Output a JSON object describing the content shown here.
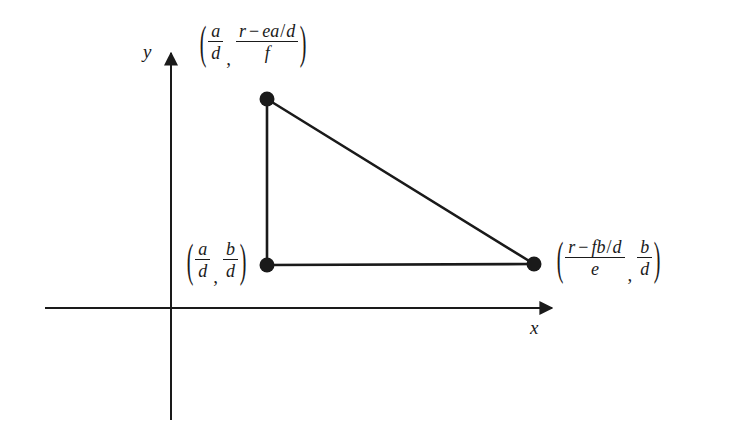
{
  "figure": {
    "type": "geometry-diagram",
    "background_color": "#ffffff",
    "ink_color": "#1a1a1a",
    "axes": {
      "x_label": "x",
      "y_label": "y",
      "origin": {
        "x": 171,
        "y": 308
      },
      "x_axis": {
        "start_x": 45,
        "end_x": 557,
        "y": 308,
        "arrow": "right"
      },
      "y_axis": {
        "x": 171,
        "start_y": 420,
        "end_y": 48,
        "arrow": "up"
      }
    },
    "vertices": [
      {
        "name": "top-vertex",
        "point": {
          "x": 267,
          "y": 99
        },
        "label": {
          "x_expr": {
            "numerator": "a",
            "denominator": "d"
          },
          "y_expr": {
            "numerator": [
              "r",
              "−",
              "ea",
              "/",
              "d"
            ],
            "denominator": "f"
          }
        }
      },
      {
        "name": "bottom-left-vertex",
        "point": {
          "x": 267,
          "y": 265
        },
        "label": {
          "x_expr": {
            "numerator": "a",
            "denominator": "d"
          },
          "y_expr": {
            "numerator": "b",
            "denominator": "d"
          }
        }
      },
      {
        "name": "bottom-right-vertex",
        "point": {
          "x": 534,
          "y": 264
        },
        "label": {
          "x_expr": {
            "numerator": [
              "r",
              "−",
              "fb",
              "/",
              "d"
            ],
            "denominator": "e"
          },
          "y_expr": {
            "numerator": "b",
            "denominator": "d"
          }
        }
      }
    ],
    "edges": [
      {
        "name": "vertical-leg",
        "from": "top-vertex",
        "to": "bottom-left-vertex"
      },
      {
        "name": "horizontal-leg",
        "from": "bottom-left-vertex",
        "to": "bottom-right-vertex"
      },
      {
        "name": "hypotenuse",
        "from": "top-vertex",
        "to": "bottom-right-vertex"
      }
    ],
    "tokens": {
      "open_paren": "(",
      "close_paren": ")",
      "comma": ",",
      "minus": "−",
      "slash": "/",
      "a": "a",
      "b": "b",
      "d": "d",
      "e": "e",
      "f": "f",
      "r": "r",
      "ea": "ea",
      "fb": "fb"
    }
  }
}
